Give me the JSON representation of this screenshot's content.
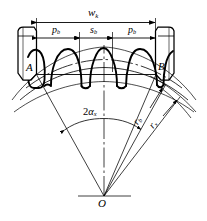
{
  "figure": {
    "name": "gear-span-measurement-diagram",
    "stroke_color": "#000000",
    "background_color": "#ffffff"
  },
  "dimensions": {
    "span": {
      "symbol": "w",
      "subscript": "k",
      "name": "span-width-Wk"
    },
    "base_pitch_left": {
      "symbol": "p",
      "subscript": "b",
      "name": "base-pitch-left"
    },
    "base_tooth_thickness": {
      "symbol": "s",
      "subscript": "b",
      "name": "base-tooth-thickness"
    },
    "base_pitch_right": {
      "symbol": "p",
      "subscript": "b",
      "name": "base-pitch-right"
    }
  },
  "points": {
    "contact_left": {
      "label": "A",
      "name": "contact-point-A"
    },
    "contact_right": {
      "label": "B",
      "name": "contact-point-B"
    },
    "center": {
      "label": "O",
      "name": "gear-center-O"
    }
  },
  "angles": {
    "span_angle": {
      "prefix": "2",
      "symbol": "α",
      "subscript": "x",
      "name": "span-half-angle-2alpha-x"
    }
  },
  "radii": {
    "base_radius": {
      "symbol": "r",
      "subscript": "b",
      "name": "base-radius-rb"
    },
    "outer_radius": {
      "symbol": "r",
      "subscript": "x",
      "name": "outer-radius-rx"
    }
  }
}
